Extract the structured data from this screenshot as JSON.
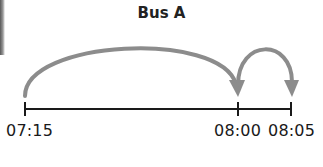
{
  "diagram": {
    "title": "Bus A",
    "timeline": {
      "ticks": [
        {
          "label": "07:15",
          "x": 25
        },
        {
          "label": "08:00",
          "x": 238
        },
        {
          "label": "08:05",
          "x": 291
        }
      ]
    },
    "jumps": [
      {
        "from": "07:15",
        "to": "08:00"
      },
      {
        "from": "08:00",
        "to": "08:05"
      }
    ],
    "colors": {
      "arrow": "#8c8c8c",
      "axis": "#1a1a1a",
      "text": "#1a1a1a"
    }
  }
}
